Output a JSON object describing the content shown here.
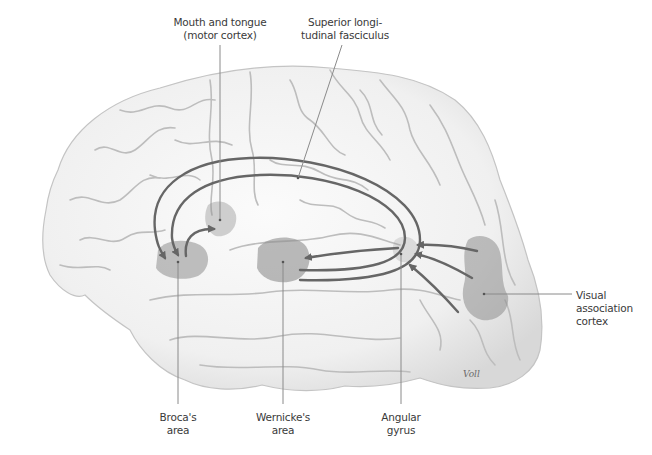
{
  "figure": {
    "signature": "Voll",
    "colors": {
      "background": "#ffffff",
      "brain_fill": "#efefef",
      "sulci": "#b9b9b9",
      "area_shade": "#8e8e8e",
      "arrows": "#666666",
      "leader_lines": "#8a8a8a",
      "text": "#3a3a3a"
    }
  },
  "labels": {
    "mouth_tongue": {
      "line1": "Mouth and tongue",
      "line2": "(motor cortex)"
    },
    "slf": {
      "line1": "Superior longi-",
      "line2": "tudinal fasciculus"
    },
    "broca": {
      "line1": "Broca's",
      "line2": "area"
    },
    "wernicke": {
      "line1": "Wernicke's",
      "line2": "area"
    },
    "angular": {
      "line1": "Angular",
      "line2": "gyrus"
    },
    "visual": {
      "line1": "Visual",
      "line2": "association",
      "line3": "cortex"
    }
  },
  "regions": [
    {
      "name": "Broca's area",
      "cx": 180,
      "cy": 262
    },
    {
      "name": "Mouth and tongue (motor cortex)",
      "cx": 220,
      "cy": 220
    },
    {
      "name": "Wernicke's area",
      "cx": 283,
      "cy": 262
    },
    {
      "name": "Angular gyrus",
      "cx": 404,
      "cy": 254
    },
    {
      "name": "Visual association cortex",
      "cx": 485,
      "cy": 290
    }
  ],
  "pathways": [
    "Visual association cortex → Angular gyrus (3 arrows)",
    "Angular gyrus → Wernicke's area (3 arrows)",
    "Wernicke's area → Broca's area via superior longitudinal fasciculus (2 arcs)",
    "Broca's area → Mouth and tongue motor cortex"
  ]
}
